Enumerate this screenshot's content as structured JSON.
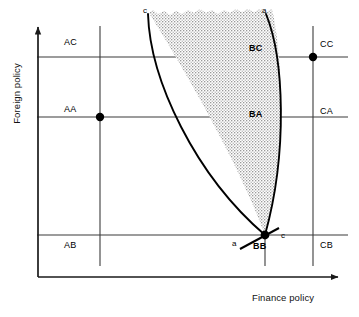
{
  "figure": {
    "type": "economic-policy-assignment-diagram",
    "axes": {
      "x_label": "Finance policy",
      "y_label": "Foreign policy"
    },
    "columns": [
      {
        "id": "A",
        "x": 100
      },
      {
        "id": "B",
        "x": 265
      },
      {
        "id": "C",
        "x": 313
      }
    ],
    "rows": [
      {
        "id": "C",
        "y": 57
      },
      {
        "id": "A",
        "y": 117
      },
      {
        "id": "B",
        "y": 235
      }
    ],
    "grid_labels": [
      {
        "name": "AC",
        "text": "AC",
        "x": 64,
        "y": 37,
        "bold": false
      },
      {
        "name": "AA",
        "text": "AA",
        "x": 64,
        "y": 104,
        "bold": false
      },
      {
        "name": "AB",
        "text": "AB",
        "x": 64,
        "y": 240,
        "bold": false
      },
      {
        "name": "BC",
        "text": "BC",
        "x": 249,
        "y": 43,
        "bold": true
      },
      {
        "name": "BA",
        "text": "BA",
        "x": 249,
        "y": 109,
        "bold": true
      },
      {
        "name": "BB",
        "text": "BB",
        "x": 253,
        "y": 241,
        "bold": true
      },
      {
        "name": "CC",
        "text": "CC",
        "x": 320,
        "y": 39,
        "bold": false
      },
      {
        "name": "CA",
        "text": "CA",
        "x": 320,
        "y": 106,
        "bold": false
      },
      {
        "name": "CB",
        "text": "CB",
        "x": 320,
        "y": 240,
        "bold": false
      }
    ],
    "points": [
      {
        "name": "point-aa",
        "x": 100,
        "y": 117
      },
      {
        "name": "point-cc",
        "x": 313,
        "y": 57
      },
      {
        "name": "point-bb",
        "x": 265,
        "y": 235
      }
    ],
    "curve_labels": [
      {
        "name": "curve-c-top",
        "text": "c",
        "x": 143,
        "y": 6
      },
      {
        "name": "curve-a-top",
        "text": "a",
        "x": 262,
        "y": 6
      },
      {
        "name": "curve-a-bottom",
        "text": "a",
        "x": 232,
        "y": 239
      },
      {
        "name": "curve-c-bottom",
        "text": "c",
        "x": 281,
        "y": 231
      }
    ],
    "colors": {
      "line": "#1a1a1a",
      "grid": "#3b3b3b",
      "shade_fill": "#d8d8d8",
      "shade_border": "#000000",
      "background": "#ffffff"
    }
  }
}
